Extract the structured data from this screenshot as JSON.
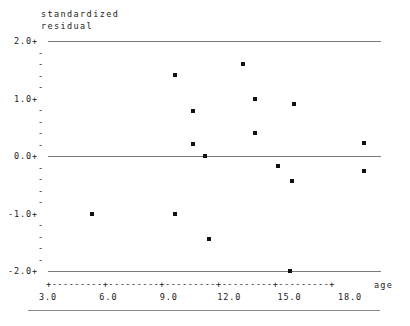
{
  "chart_data": {
    "type": "scatter",
    "title": "",
    "ylabel_line1": "standardized",
    "ylabel_line2": "residual",
    "xlabel": "age",
    "xlim": [
      2.0,
      19.3
    ],
    "ylim": [
      -2.0,
      2.0
    ],
    "grid": false,
    "gridlines_at": [
      2.0,
      0.0,
      -2.0
    ],
    "y_ticks_major": [
      "2.0+",
      "1.0+",
      "0.0+",
      "-1.0+",
      "-2.0+"
    ],
    "y_tick_values": [
      2.0,
      1.0,
      0.0,
      -1.0,
      -2.0
    ],
    "y_minor_marker": "-",
    "y_minor_per_interval": 4,
    "x_ticks": [
      "3.0",
      "6.0",
      "9.0",
      "12.0",
      "15.0",
      "18.0"
    ],
    "x_tick_values": [
      3.0,
      6.0,
      9.0,
      12.0,
      15.0,
      18.0
    ],
    "x_axis_rule": "+---------+---------+---------+---------+---------+",
    "marker": "*",
    "points": [
      {
        "x": 5.2,
        "y": -1.0
      },
      {
        "x": 9.3,
        "y": -1.0
      },
      {
        "x": 9.3,
        "y": 1.41
      },
      {
        "x": 10.2,
        "y": 0.79
      },
      {
        "x": 10.2,
        "y": 0.21
      },
      {
        "x": 10.8,
        "y": 0.0
      },
      {
        "x": 11.0,
        "y": -1.44
      },
      {
        "x": 12.7,
        "y": 1.6
      },
      {
        "x": 13.3,
        "y": 0.99
      },
      {
        "x": 13.3,
        "y": 0.4
      },
      {
        "x": 14.4,
        "y": -0.17
      },
      {
        "x": 15.0,
        "y": -2.0
      },
      {
        "x": 15.1,
        "y": -0.43
      },
      {
        "x": 15.2,
        "y": 0.9
      },
      {
        "x": 18.7,
        "y": 0.23
      },
      {
        "x": 18.7,
        "y": -0.26
      }
    ]
  }
}
